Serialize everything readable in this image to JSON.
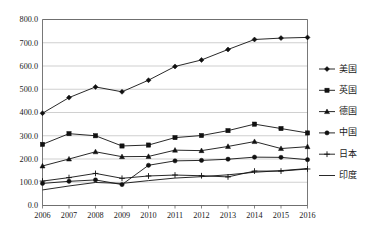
{
  "chart_data": {
    "type": "line",
    "title": "",
    "subtitle": "",
    "xlabel": "",
    "ylabel": "",
    "grid": true,
    "legend_position": "right",
    "categories": [
      "2006",
      "2007",
      "2008",
      "2009",
      "2010",
      "2011",
      "2012",
      "2013",
      "2014",
      "2015",
      "2016"
    ],
    "x_tick_labels": [
      "2006",
      "2007",
      "2008",
      "2009",
      "2010",
      "2011",
      "2012",
      "2013",
      "2014",
      "2015",
      "2016"
    ],
    "y_tick_labels": [
      "0.0",
      "100.0",
      "200.0",
      "300.0",
      "400.0",
      "500.0",
      "600.0",
      "700.0",
      "800.0"
    ],
    "y_ticks": [
      0,
      100,
      200,
      300,
      400,
      500,
      600,
      700,
      800
    ],
    "ylim": [
      0,
      800
    ],
    "series": [
      {
        "name": "美国",
        "marker": "diamond",
        "color": "#111111",
        "values": [
          397,
          464,
          510,
          489,
          539,
          598,
          626,
          671,
          714,
          720,
          723
        ]
      },
      {
        "name": "英国",
        "marker": "square",
        "color": "#111111",
        "values": [
          263,
          309,
          300,
          256,
          260,
          292,
          301,
          322,
          350,
          331,
          312
        ]
      },
      {
        "name": "德国",
        "marker": "triangle",
        "color": "#111111",
        "values": [
          170,
          200,
          231,
          210,
          211,
          238,
          236,
          254,
          275,
          245,
          253
        ]
      },
      {
        "name": "中国",
        "marker": "circle",
        "color": "#111111",
        "values": [
          95,
          104,
          110,
          90,
          173,
          192,
          194,
          199,
          208,
          207,
          197
        ]
      },
      {
        "name": "日本",
        "marker": "plus",
        "color": "#111111",
        "values": [
          105,
          120,
          138,
          117,
          127,
          131,
          128,
          123,
          148,
          148,
          157
        ]
      },
      {
        "name": "印度",
        "marker": "none",
        "color": "#111111",
        "values": [
          67,
          84,
          99,
          95,
          107,
          118,
          124,
          132,
          143,
          150,
          159
        ]
      }
    ]
  },
  "legend": {
    "items": [
      {
        "label": "美国",
        "marker": "diamond"
      },
      {
        "label": "英国",
        "marker": "square"
      },
      {
        "label": "德国",
        "marker": "triangle"
      },
      {
        "label": "中国",
        "marker": "circle"
      },
      {
        "label": "日本",
        "marker": "plus"
      },
      {
        "label": "印度",
        "marker": "none"
      }
    ]
  }
}
